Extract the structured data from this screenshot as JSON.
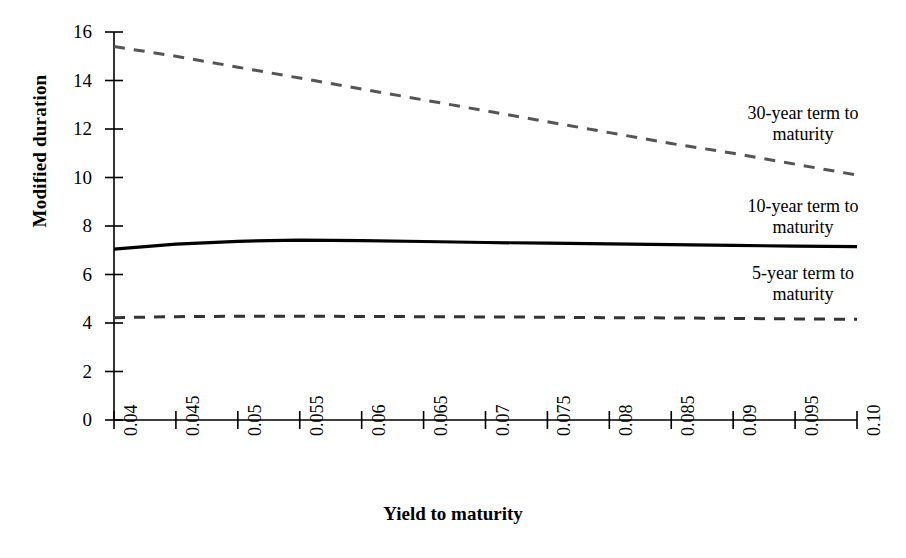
{
  "chart_data": {
    "type": "line",
    "title": "",
    "xlabel": "Yield to maturity",
    "ylabel": "Modified duration",
    "xlim": [
      0.04,
      0.1
    ],
    "ylim": [
      0,
      16
    ],
    "grid": false,
    "legend_position": "inline-right-annotations",
    "x": [
      0.04,
      0.045,
      0.05,
      0.055,
      0.06,
      0.065,
      0.07,
      0.075,
      0.08,
      0.085,
      0.09,
      0.095,
      0.1
    ],
    "xticklabels": [
      "0.04",
      "0.045",
      "0.05",
      "0.055",
      "0.06",
      "0.065",
      "0.07",
      "0.075",
      "0.08",
      "0.085",
      "0.09",
      "0.095",
      "0.10"
    ],
    "yticks": [
      0,
      2,
      4,
      6,
      8,
      10,
      12,
      14,
      16
    ],
    "yticklabels": [
      "0",
      "2",
      "4",
      "6",
      "8",
      "10",
      "12",
      "14",
      "16"
    ],
    "series": [
      {
        "name": "30-year term to maturity",
        "style": "dashed",
        "color": "#555555",
        "values": [
          15.4,
          15.0,
          14.55,
          14.1,
          13.65,
          13.2,
          12.75,
          12.3,
          11.85,
          11.4,
          11.0,
          10.55,
          10.1
        ]
      },
      {
        "name": "10-year term to maturity",
        "style": "solid",
        "color": "#000000",
        "values": [
          7.05,
          7.25,
          7.37,
          7.42,
          7.4,
          7.36,
          7.32,
          7.29,
          7.26,
          7.23,
          7.2,
          7.17,
          7.15
        ]
      },
      {
        "name": "5-year term to maturity",
        "style": "dashed",
        "color": "#333333",
        "values": [
          4.22,
          4.26,
          4.28,
          4.28,
          4.27,
          4.26,
          4.25,
          4.24,
          4.22,
          4.21,
          4.19,
          4.17,
          4.15
        ]
      }
    ],
    "annotations": [
      {
        "key": "a30",
        "line1": "30-year term to",
        "line2": "maturity"
      },
      {
        "key": "a10",
        "line1": "10-year term to",
        "line2": "maturity"
      },
      {
        "key": "a5",
        "line1": "5-year term to",
        "line2": "maturity"
      }
    ]
  }
}
